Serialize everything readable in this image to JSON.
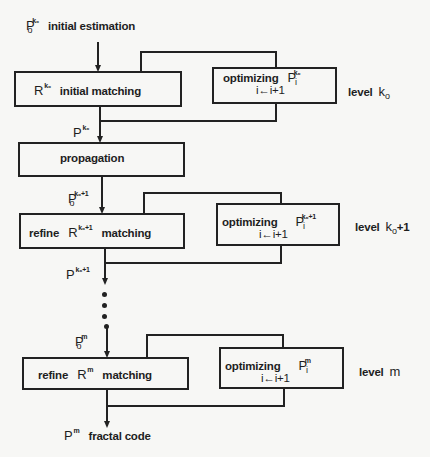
{
  "diagram": {
    "type": "flowchart",
    "title": "",
    "top_input": {
      "symbol": "P",
      "sub": "o",
      "sup": "k₀",
      "label": "initial estimation"
    },
    "levels": [
      {
        "main_box": {
          "prefix": "",
          "symbol": "R",
          "sup": "k₀",
          "label": "initial matching"
        },
        "opt_box": {
          "label": "optimizing",
          "symbol": "P",
          "sub": "i",
          "sup": "k₀",
          "iter": "i←i+1"
        },
        "level_label": "level",
        "level_value": "k",
        "level_sub": "o",
        "level_suffix": "",
        "output": {
          "symbol": "P",
          "sup": "k₀"
        }
      },
      {
        "main_box": {
          "prefix": "refine",
          "symbol": "R",
          "sup": "k₀+1",
          "label": "matching"
        },
        "opt_box": {
          "label": "optimizing",
          "symbol": "P",
          "sub": "i",
          "sup": "k₀+1",
          "iter": "i←i+1"
        },
        "level_label": "level",
        "level_value": "k",
        "level_sub": "o",
        "level_suffix": "+1",
        "input": {
          "symbol": "P",
          "sub": "o",
          "sup": "k₀+1"
        },
        "output": {
          "symbol": "P",
          "sup": "k₀+1"
        }
      },
      {
        "main_box": {
          "prefix": "refine",
          "symbol": "R",
          "sup": "m",
          "label": "matching"
        },
        "opt_box": {
          "label": "optimizing",
          "symbol": "P",
          "sub": "i",
          "sup": "m",
          "iter": "i←i+1"
        },
        "level_label": "level",
        "level_value": "m",
        "level_sub": "",
        "level_suffix": "",
        "input": {
          "symbol": "P",
          "sub": "o",
          "sup": "m"
        },
        "output": {
          "symbol": "P",
          "sup": "m"
        }
      }
    ],
    "propagation": {
      "label": "propagation"
    },
    "final_output": {
      "symbol": "P",
      "sup": "m",
      "label": "fractal code"
    },
    "ellipsis": "⋮"
  },
  "colors": {
    "ink": "#222222",
    "paper": "#f7f7f5"
  }
}
